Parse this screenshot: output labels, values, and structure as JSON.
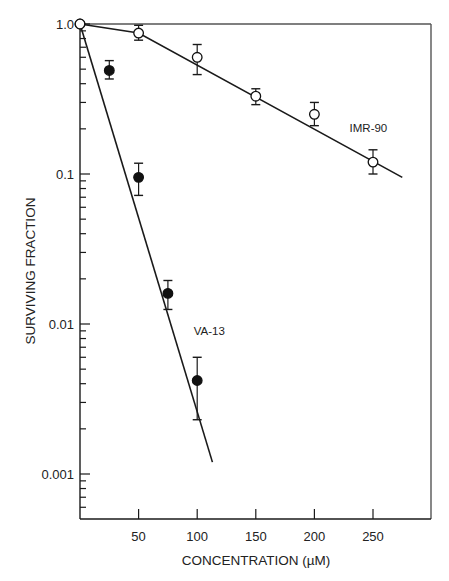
{
  "chart_data": {
    "type": "scatter",
    "title": "",
    "xlabel": "CONCENTRATION (µM)",
    "ylabel": "SURVIVING FRACTION",
    "xscale": "linear",
    "yscale": "log",
    "xlim": [
      0,
      300
    ],
    "ylim": [
      0.0006,
      1.0
    ],
    "x_ticks": [
      50,
      100,
      150,
      200,
      250
    ],
    "x_tick_labels": [
      "50",
      "100",
      "150",
      "200",
      "250"
    ],
    "y_ticks": [
      1.0,
      0.1,
      0.01,
      0.001
    ],
    "y_tick_labels": [
      "1.0",
      "0.1",
      "0.01",
      "0.001"
    ],
    "grid": false,
    "legend": "none (series labeled inline)",
    "series": [
      {
        "name": "VA-13",
        "marker": "filled-circle",
        "x": [
          0,
          25,
          50,
          75,
          100
        ],
        "values": [
          1.0,
          0.49,
          0.095,
          0.016,
          0.0042
        ],
        "error_low": [
          1.0,
          0.43,
          0.072,
          0.0125,
          0.0023
        ],
        "error_high": [
          1.0,
          0.57,
          0.118,
          0.0195,
          0.006
        ],
        "fit_line": {
          "x": [
            0,
            113
          ],
          "y": [
            1.0,
            0.0012
          ]
        },
        "label_position": {
          "x": 97,
          "y": 0.0085
        }
      },
      {
        "name": "IMR-90",
        "marker": "open-circle",
        "x": [
          0,
          50,
          100,
          150,
          200,
          250
        ],
        "values": [
          1.0,
          0.87,
          0.6,
          0.33,
          0.25,
          0.12
        ],
        "error_low": [
          1.0,
          0.78,
          0.46,
          0.29,
          0.21,
          0.1
        ],
        "error_high": [
          1.0,
          0.98,
          0.73,
          0.37,
          0.3,
          0.145
        ],
        "fit_line": {
          "x": [
            0,
            50,
            275
          ],
          "y": [
            1.0,
            0.87,
            0.095
          ]
        },
        "label_position": {
          "x": 230,
          "y": 0.19
        }
      }
    ]
  },
  "labels": {
    "xlabel": "CONCENTRATION (µM)",
    "ylabel": "SURVIVING FRACTION",
    "va13": "VA-13",
    "imr90": "IMR-90"
  }
}
